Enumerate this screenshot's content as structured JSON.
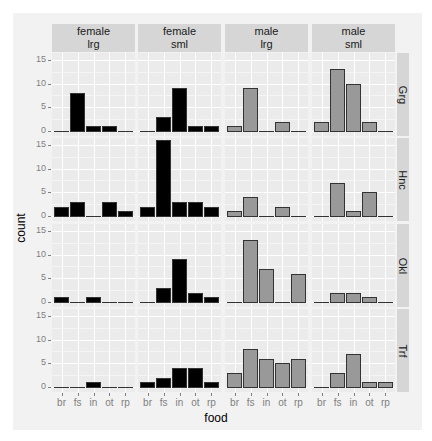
{
  "chart_data": {
    "type": "bar",
    "title": "",
    "xlabel": "food",
    "ylabel": "count",
    "ylim": [
      0,
      16
    ],
    "yticks": [
      0,
      5,
      10,
      15
    ],
    "grid": true,
    "categories": [
      "br",
      "fs",
      "in",
      "ot",
      "rp"
    ],
    "facet_columns": [
      {
        "sex": "female",
        "size": "lrg",
        "fill": "#000000"
      },
      {
        "sex": "female",
        "size": "sml",
        "fill": "#000000"
      },
      {
        "sex": "male",
        "size": "lrg",
        "fill": "#999999"
      },
      {
        "sex": "male",
        "size": "sml",
        "fill": "#999999"
      }
    ],
    "facet_rows": [
      "Grg",
      "Hnc",
      "Okl",
      "Trf"
    ],
    "panels": {
      "Grg": [
        [
          0,
          8,
          1,
          1,
          0
        ],
        [
          0,
          3,
          9,
          1,
          1
        ],
        [
          1,
          9,
          0,
          2,
          0
        ],
        [
          2,
          13,
          10,
          2,
          0
        ]
      ],
      "Hnc": [
        [
          2,
          3,
          0,
          3,
          1
        ],
        [
          2,
          16,
          3,
          3,
          2
        ],
        [
          1,
          4,
          0,
          2,
          0
        ],
        [
          0,
          7,
          1,
          5,
          0
        ]
      ],
      "Okl": [
        [
          1,
          0,
          1,
          0,
          0
        ],
        [
          0,
          3,
          9,
          2,
          1
        ],
        [
          0,
          13,
          7,
          0,
          6
        ],
        [
          0,
          2,
          2,
          1,
          0
        ]
      ],
      "Trf": [
        [
          0,
          0,
          1,
          0,
          0
        ],
        [
          1,
          2,
          4,
          4,
          1
        ],
        [
          3,
          8,
          6,
          5,
          6
        ],
        [
          0,
          3,
          7,
          1,
          1
        ]
      ]
    }
  }
}
